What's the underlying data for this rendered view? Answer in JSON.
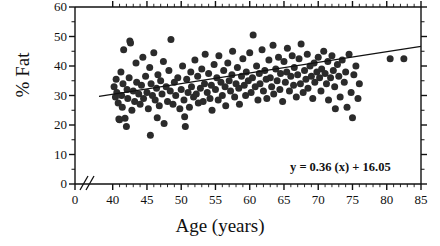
{
  "chart_data": {
    "type": "scatter",
    "title": "",
    "xlabel": "Age (years)",
    "ylabel": "% Fat",
    "xlim": [
      0,
      85
    ],
    "ylim": [
      0,
      60
    ],
    "axis_break": {
      "present": true,
      "between": [
        0,
        38
      ],
      "symbol": "//"
    },
    "grid": false,
    "legend": false,
    "xticks": [
      0,
      40,
      45,
      50,
      55,
      60,
      65,
      70,
      75,
      80,
      85
    ],
    "xtick_labels": [
      "0",
      "40",
      "45",
      "50",
      "55",
      "60",
      "65",
      "70",
      "75",
      "80",
      "85"
    ],
    "xminor_step": 1,
    "yticks": [
      0,
      10,
      20,
      30,
      40,
      50,
      60
    ],
    "ytick_labels": [
      "0",
      "10",
      "20",
      "30",
      "40",
      "50",
      "60"
    ],
    "yminor_step": 5,
    "marker": {
      "shape": "circle",
      "color": "#2b2b2b",
      "size_px": 7
    },
    "trendline": {
      "type": "linear",
      "slope": 0.36,
      "intercept": 16.05,
      "annotation": "y = 0.36 (x) + 16.05",
      "color": "#111111",
      "x_start": 38,
      "x_end": 85,
      "y_start": 29.7,
      "y_end": 46.6
    },
    "points": [
      [
        40.2,
        33.0
      ],
      [
        40.4,
        29.5
      ],
      [
        40.5,
        35.5
      ],
      [
        40.6,
        31.0
      ],
      [
        40.8,
        27.5
      ],
      [
        40.9,
        22.0
      ],
      [
        41.0,
        21.8
      ],
      [
        41.2,
        38.0
      ],
      [
        41.3,
        30.0
      ],
      [
        41.4,
        26.0
      ],
      [
        41.5,
        34.0
      ],
      [
        41.6,
        45.5
      ],
      [
        41.8,
        22.3
      ],
      [
        42.0,
        19.5
      ],
      [
        42.1,
        32.0
      ],
      [
        42.2,
        29.0
      ],
      [
        42.4,
        36.0
      ],
      [
        42.5,
        48.5
      ],
      [
        42.6,
        47.8
      ],
      [
        42.8,
        25.0
      ],
      [
        43.0,
        31.5
      ],
      [
        43.2,
        28.0
      ],
      [
        43.4,
        41.0
      ],
      [
        43.5,
        34.5
      ],
      [
        43.8,
        30.5
      ],
      [
        44.0,
        27.0
      ],
      [
        44.2,
        33.5
      ],
      [
        44.4,
        43.0
      ],
      [
        44.5,
        29.0
      ],
      [
        44.8,
        36.5
      ],
      [
        45.0,
        31.0
      ],
      [
        45.2,
        25.5
      ],
      [
        45.4,
        39.5
      ],
      [
        45.5,
        16.5
      ],
      [
        45.6,
        34.0
      ],
      [
        45.8,
        30.0
      ],
      [
        46.0,
        44.5
      ],
      [
        46.2,
        28.5
      ],
      [
        46.4,
        32.5
      ],
      [
        46.5,
        22.5
      ],
      [
        46.6,
        37.0
      ],
      [
        46.8,
        26.5
      ],
      [
        47.0,
        35.0
      ],
      [
        47.2,
        30.5
      ],
      [
        47.4,
        41.5
      ],
      [
        47.5,
        20.5
      ],
      [
        47.8,
        33.0
      ],
      [
        48.0,
        28.0
      ],
      [
        48.2,
        38.5
      ],
      [
        48.4,
        31.5
      ],
      [
        48.5,
        49.0
      ],
      [
        48.8,
        27.0
      ],
      [
        49.0,
        34.5
      ],
      [
        49.2,
        30.0
      ],
      [
        49.5,
        36.0
      ],
      [
        49.8,
        25.5
      ],
      [
        50.0,
        32.0
      ],
      [
        50.2,
        40.0
      ],
      [
        50.4,
        28.5
      ],
      [
        50.5,
        22.8
      ],
      [
        50.6,
        19.5
      ],
      [
        50.8,
        35.5
      ],
      [
        51.0,
        31.0
      ],
      [
        51.2,
        26.0
      ],
      [
        51.4,
        38.0
      ],
      [
        51.5,
        33.0
      ],
      [
        51.8,
        29.5
      ],
      [
        52.0,
        42.0
      ],
      [
        52.2,
        30.5
      ],
      [
        52.4,
        36.5
      ],
      [
        52.5,
        27.5
      ],
      [
        52.8,
        32.5
      ],
      [
        53.0,
        39.0
      ],
      [
        53.2,
        28.0
      ],
      [
        53.4,
        34.0
      ],
      [
        53.5,
        44.0
      ],
      [
        53.8,
        31.0
      ],
      [
        54.0,
        37.5
      ],
      [
        54.2,
        29.0
      ],
      [
        54.4,
        33.5
      ],
      [
        54.5,
        25.0
      ],
      [
        54.8,
        40.5
      ],
      [
        55.0,
        32.0
      ],
      [
        55.2,
        36.0
      ],
      [
        55.4,
        28.5
      ],
      [
        55.5,
        43.5
      ],
      [
        55.8,
        34.5
      ],
      [
        56.0,
        30.0
      ],
      [
        56.2,
        38.5
      ],
      [
        56.4,
        33.0
      ],
      [
        56.5,
        26.5
      ],
      [
        56.8,
        41.0
      ],
      [
        57.0,
        35.0
      ],
      [
        57.2,
        31.5
      ],
      [
        57.4,
        37.0
      ],
      [
        57.5,
        45.0
      ],
      [
        57.8,
        29.5
      ],
      [
        58.0,
        34.0
      ],
      [
        58.2,
        39.5
      ],
      [
        58.4,
        32.5
      ],
      [
        58.5,
        27.0
      ],
      [
        58.8,
        36.5
      ],
      [
        59.0,
        42.5
      ],
      [
        59.2,
        33.5
      ],
      [
        59.4,
        30.0
      ],
      [
        59.5,
        38.0
      ],
      [
        59.8,
        35.0
      ],
      [
        60.0,
        44.5
      ],
      [
        60.2,
        31.0
      ],
      [
        60.4,
        36.0
      ],
      [
        60.5,
        50.5
      ],
      [
        60.8,
        33.0
      ],
      [
        61.0,
        40.0
      ],
      [
        61.2,
        28.5
      ],
      [
        61.4,
        37.5
      ],
      [
        61.5,
        34.0
      ],
      [
        61.8,
        45.5
      ],
      [
        62.0,
        31.5
      ],
      [
        62.2,
        38.5
      ],
      [
        62.4,
        35.5
      ],
      [
        62.5,
        29.0
      ],
      [
        62.8,
        42.0
      ],
      [
        63.0,
        36.0
      ],
      [
        63.2,
        33.0
      ],
      [
        63.4,
        47.0
      ],
      [
        63.5,
        30.5
      ],
      [
        63.8,
        39.0
      ],
      [
        64.0,
        35.0
      ],
      [
        64.2,
        43.0
      ],
      [
        64.4,
        32.0
      ],
      [
        64.5,
        37.5
      ],
      [
        64.8,
        28.0
      ],
      [
        65.0,
        41.5
      ],
      [
        65.2,
        34.5
      ],
      [
        65.4,
        38.0
      ],
      [
        65.5,
        46.0
      ],
      [
        65.8,
        31.5
      ],
      [
        66.0,
        36.5
      ],
      [
        66.2,
        43.5
      ],
      [
        66.4,
        33.5
      ],
      [
        66.5,
        39.5
      ],
      [
        66.8,
        29.5
      ],
      [
        67.0,
        37.0
      ],
      [
        67.2,
        42.5
      ],
      [
        67.4,
        34.0
      ],
      [
        67.5,
        47.5
      ],
      [
        67.8,
        31.0
      ],
      [
        68.0,
        38.5
      ],
      [
        68.2,
        35.5
      ],
      [
        68.4,
        44.0
      ],
      [
        68.5,
        32.5
      ],
      [
        68.8,
        40.0
      ],
      [
        69.0,
        36.5
      ],
      [
        69.2,
        29.0
      ],
      [
        69.4,
        41.0
      ],
      [
        69.5,
        34.5
      ],
      [
        69.8,
        38.0
      ],
      [
        70.0,
        43.0
      ],
      [
        70.2,
        36.0
      ],
      [
        70.4,
        31.5
      ],
      [
        70.5,
        39.0
      ],
      [
        70.8,
        45.0
      ],
      [
        71.0,
        37.5
      ],
      [
        71.2,
        34.0
      ],
      [
        71.4,
        41.5
      ],
      [
        71.5,
        28.5
      ],
      [
        71.8,
        36.0
      ],
      [
        72.0,
        43.5
      ],
      [
        72.2,
        38.5
      ],
      [
        72.4,
        33.0
      ],
      [
        72.5,
        25.5
      ],
      [
        72.8,
        40.5
      ],
      [
        73.0,
        36.5
      ],
      [
        73.2,
        29.5
      ],
      [
        73.5,
        42.0
      ],
      [
        73.8,
        34.5
      ],
      [
        74.0,
        38.0
      ],
      [
        74.2,
        26.0
      ],
      [
        74.5,
        44.0
      ],
      [
        74.8,
        31.0
      ],
      [
        75.0,
        22.5
      ],
      [
        75.2,
        37.0
      ],
      [
        75.5,
        40.0
      ],
      [
        75.8,
        29.0
      ],
      [
        76.0,
        34.0
      ],
      [
        80.5,
        42.5
      ],
      [
        82.5,
        42.5
      ]
    ]
  },
  "annotation": {
    "equation": "y = 0.36 (x) + 16.05"
  }
}
